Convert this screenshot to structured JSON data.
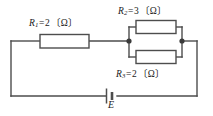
{
  "figure": {
    "type": "electrical-circuit-schematic",
    "background_color": "#ffffff",
    "line_color": "#4d4d4d",
    "text_color": "#1a1a1a"
  },
  "components": {
    "r1": {
      "symbol": "R",
      "subscript": "1",
      "equals": "=",
      "value": "2",
      "unit": "〔Ω〕",
      "label": "R1=2〔Ω〕",
      "type": "resistor",
      "connection": "series"
    },
    "r2": {
      "symbol": "R",
      "subscript": "2",
      "equals": "=",
      "value": "3",
      "unit": "〔Ω〕",
      "label": "R2=3〔Ω〕",
      "type": "resistor",
      "connection": "parallel-upper"
    },
    "r3": {
      "symbol": "R",
      "subscript": "3",
      "equals": "=",
      "value": "2",
      "unit": "〔Ω〕",
      "label": "R3=2〔Ω〕",
      "type": "resistor",
      "connection": "parallel-lower"
    },
    "source": {
      "symbol": "E",
      "label": "E",
      "type": "dc-voltage-source"
    }
  }
}
